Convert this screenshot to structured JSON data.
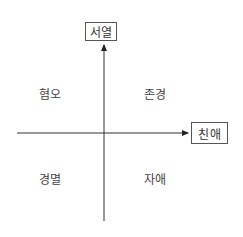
{
  "diagram": {
    "type": "quadrant",
    "axes": {
      "vertical": {
        "label": "서열",
        "direction": "up"
      },
      "horizontal": {
        "label": "친애",
        "direction": "right"
      }
    },
    "quadrants": {
      "top_left": "혐오",
      "top_right": "존경",
      "bottom_left": "경멸",
      "bottom_right": "자애"
    },
    "colors": {
      "line": "#333333",
      "box_border": "#555555",
      "text": "#333333"
    }
  }
}
